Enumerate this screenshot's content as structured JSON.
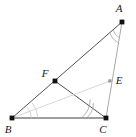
{
  "figure": {
    "kind": "geometry-diagram",
    "width": 136,
    "height": 137,
    "background": "#ffffff"
  },
  "colors": {
    "primary_stroke": "#3d3d3d",
    "secondary_stroke": "#b8b8b8",
    "light_stroke": "#cfcfcf",
    "vertex_fill": "#111111",
    "small_point_fill": "#8c8c8c",
    "label_color": "#1a1a1a"
  },
  "points": [
    {
      "id": "A",
      "label": "A",
      "x": 122,
      "y": 22,
      "label_x": 119,
      "label_y": 12,
      "marker": "large"
    },
    {
      "id": "B",
      "label": "B",
      "x": 12,
      "y": 118,
      "label_x": 8,
      "label_y": 133,
      "marker": "large"
    },
    {
      "id": "C",
      "label": "C",
      "x": 106,
      "y": 118,
      "label_x": 103,
      "label_y": 133,
      "marker": "large"
    },
    {
      "id": "F",
      "label": "F",
      "x": 55,
      "y": 81,
      "label_x": 45,
      "label_y": 77,
      "marker": "large"
    },
    {
      "id": "E",
      "label": "E",
      "x": 110,
      "y": 81,
      "label_x": 116,
      "label_y": 84,
      "marker": "small"
    }
  ],
  "segments": [
    {
      "id": "AB",
      "from": "A",
      "to": "B",
      "style": "primary",
      "width": 0.9
    },
    {
      "id": "BC",
      "from": "B",
      "to": "C",
      "style": "primary",
      "width": 1.1
    },
    {
      "id": "AC",
      "from": "A",
      "to": "C",
      "style": "secondary",
      "width": 0.9
    },
    {
      "id": "CF",
      "from": "C",
      "to": "F",
      "style": "primary",
      "width": 0.9
    },
    {
      "id": "BE",
      "from": "B",
      "to": "E",
      "style": "light",
      "width": 0.9
    }
  ],
  "angle_marks": [
    {
      "id": "angle-A",
      "at": "A",
      "arcs": 2,
      "style": "secondary",
      "note": "double arc at vertex A"
    },
    {
      "id": "angle-B",
      "at": "B",
      "arcs": 2,
      "style": "light",
      "note": "double arc at vertex B"
    },
    {
      "id": "angle-C",
      "at": "C",
      "arcs": 2,
      "style": "secondary",
      "note": "double tick at vertex C"
    }
  ]
}
